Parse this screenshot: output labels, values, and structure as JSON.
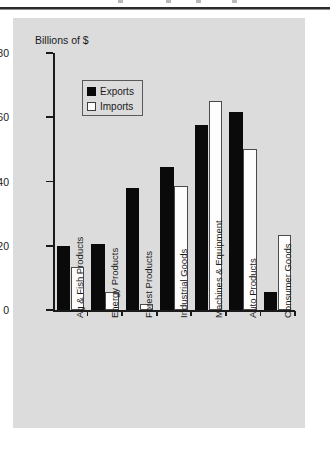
{
  "page": {
    "background_color": "#ffffff",
    "panel_color": "#dcdcdc",
    "rule_color": "#2b2b2b"
  },
  "chart_data": {
    "type": "bar",
    "title": "",
    "subtitle": "",
    "xlabel": "",
    "ylabel": "Billions of $",
    "ylim": [
      0,
      80
    ],
    "yticks": [
      0,
      20,
      40,
      60,
      80
    ],
    "ytick_labels": [
      "0",
      "20",
      "40",
      "60",
      "80"
    ],
    "grid": false,
    "legend_position": "upper-left-inside",
    "categories": [
      "Ag & Fish Products",
      "Energy Products",
      "Forest Products",
      "Industrial Goods",
      "Machines & Equipment",
      "Auto Products",
      "Consumer Goods"
    ],
    "series": [
      {
        "name": "Exports",
        "color": "#0a0a0a",
        "values": [
          20,
          20.5,
          38,
          44.5,
          57.5,
          61.5,
          5.5
        ]
      },
      {
        "name": "Imports",
        "color": "#fdfdfd",
        "values": [
          13.5,
          5.5,
          2,
          38.5,
          65,
          50,
          23.5
        ]
      }
    ]
  },
  "legend": {
    "items": [
      {
        "label": "Exports",
        "swatch": "filled-square-icon"
      },
      {
        "label": "Imports",
        "swatch": "open-square-icon"
      }
    ]
  }
}
